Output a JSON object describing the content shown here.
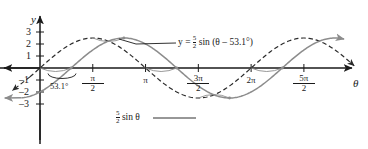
{
  "figure": {
    "kind": "sine-wave-phase-shift-graph",
    "axes": {
      "x_axis_label": "θ",
      "y_axis_label": "y",
      "x_ticks": [
        {
          "label_numerator": "π",
          "label_denominator": "2",
          "value": 1.5707963
        },
        {
          "label_numerator": "π",
          "label_denominator": "",
          "value": 3.1415927
        },
        {
          "label_numerator": "3π",
          "label_denominator": "2",
          "value": 4.712389
        },
        {
          "label_numerator": "2π",
          "label_denominator": "",
          "value": 6.2831853
        },
        {
          "label_numerator": "5π",
          "label_denominator": "2",
          "value": 7.8539816
        }
      ],
      "y_ticks": [
        {
          "label": "3",
          "value": 3
        },
        {
          "label": "2",
          "value": 2
        },
        {
          "label": "1",
          "value": 1
        },
        {
          "label": "–1",
          "value": -1
        },
        {
          "label": "–2",
          "value": -2
        },
        {
          "label": "–3",
          "value": -3
        }
      ],
      "xlim": [
        -0.95,
        9.55
      ],
      "ylim": [
        -3.6,
        3.6
      ]
    },
    "annotations": {
      "phase_angle": "53.1°",
      "shifted_curve_label_prefix": "y = ",
      "shifted_curve_amp_num": "5",
      "shifted_curve_amp_den": "2",
      "shifted_curve_label_suffix": " sin (θ – 53.1°)",
      "base_curve_amp_num": "5",
      "base_curve_amp_den": "2",
      "base_curve_label_suffix": " sin θ"
    },
    "colors": {
      "axis": "#1a1a1a",
      "text": "#1a1a1a",
      "solid_curve": "#8c8c8c",
      "dashed_curve": "#2b2b2b",
      "shift_arc": "#8c8c8c"
    }
  },
  "chart_data": {
    "type": "line",
    "title": "",
    "xlabel": "θ",
    "ylabel": "y",
    "xlim": [
      -0.95,
      9.55
    ],
    "ylim": [
      -3.6,
      3.6
    ],
    "grid": false,
    "legend": "inline-annotation",
    "xtick_labels": [
      "π/2",
      "π",
      "3π/2",
      "2π",
      "5π/2"
    ],
    "xtick_values": [
      1.5707963,
      3.1415927,
      4.712389,
      6.2831853,
      7.8539816
    ],
    "ytick_labels": [
      "3",
      "2",
      "1",
      "–1",
      "–2",
      "–3"
    ],
    "ytick_values": [
      3,
      2,
      1,
      -1,
      -2,
      -3
    ],
    "series": [
      {
        "name": "5/2 sin θ",
        "style": "dashed",
        "amplitude": 2.5,
        "phase_deg": 0,
        "period": 6.2831853,
        "key_points": [
          {
            "x": 0,
            "y": 0
          },
          {
            "x": 1.5707963,
            "y": 2.5
          },
          {
            "x": 3.1415927,
            "y": 0
          },
          {
            "x": 4.712389,
            "y": -2.5
          },
          {
            "x": 6.2831853,
            "y": 0
          },
          {
            "x": 7.8539816,
            "y": 2.5
          }
        ]
      },
      {
        "name": "y = 5/2 sin (θ – 53.1°)",
        "style": "solid",
        "amplitude": 2.5,
        "phase_deg": 53.1,
        "period": 6.2831853,
        "key_points": [
          {
            "x": 0.9268,
            "y": 0
          },
          {
            "x": 2.4976,
            "y": 2.5
          },
          {
            "x": 4.0684,
            "y": 0
          },
          {
            "x": 5.6392,
            "y": -2.5
          },
          {
            "x": 7.21,
            "y": 0
          },
          {
            "x": 8.7808,
            "y": 2.5
          }
        ]
      }
    ],
    "annotations": [
      {
        "text": "53.1°",
        "x": 0.46,
        "y": -0.75,
        "note": "phase shift angle at origin"
      },
      {
        "text": "y = 5/2 sin (θ – 53.1°)",
        "x": 3.6,
        "y": 2.45
      },
      {
        "text": "5/2 sin θ",
        "x": 2.2,
        "y": -2.35
      }
    ]
  }
}
